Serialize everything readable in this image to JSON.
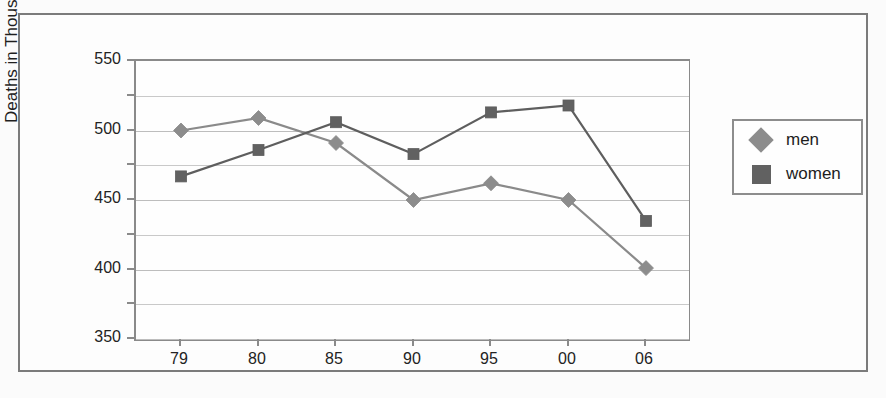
{
  "chart_data": {
    "type": "line",
    "title": "",
    "xlabel": "",
    "ylabel": "Deaths in Thousands",
    "categories": [
      "79",
      "80",
      "85",
      "90",
      "95",
      "00",
      "06"
    ],
    "yticks": [
      350,
      400,
      450,
      500,
      550
    ],
    "ytick_labels": [
      "350",
      "400",
      "450",
      "500",
      "550"
    ],
    "ylim": [
      350,
      550
    ],
    "minor_gridline_step": 25,
    "grid": true,
    "legend_position": "right",
    "series": [
      {
        "name": "men",
        "marker": "diamond",
        "color": "#8c8c8c",
        "line_color": "#8a8a8a",
        "values": [
          500,
          509,
          491,
          450,
          462,
          450,
          401
        ]
      },
      {
        "name": "women",
        "marker": "square",
        "color": "#616161",
        "line_color": "#5e5e5e",
        "values": [
          467,
          486,
          506,
          483,
          513,
          518,
          435
        ]
      }
    ]
  },
  "legend": {
    "items": [
      {
        "label": "men",
        "marker": "diamond-swatch-icon"
      },
      {
        "label": "women",
        "marker": "square-swatch-icon"
      }
    ]
  },
  "colors": {
    "men_series": "#8c8c8c",
    "women_series": "#616161",
    "frame": "#7b7b7b",
    "gridline": "#c9c9c9",
    "axis": "#8a8a8a",
    "text": "#232323"
  }
}
